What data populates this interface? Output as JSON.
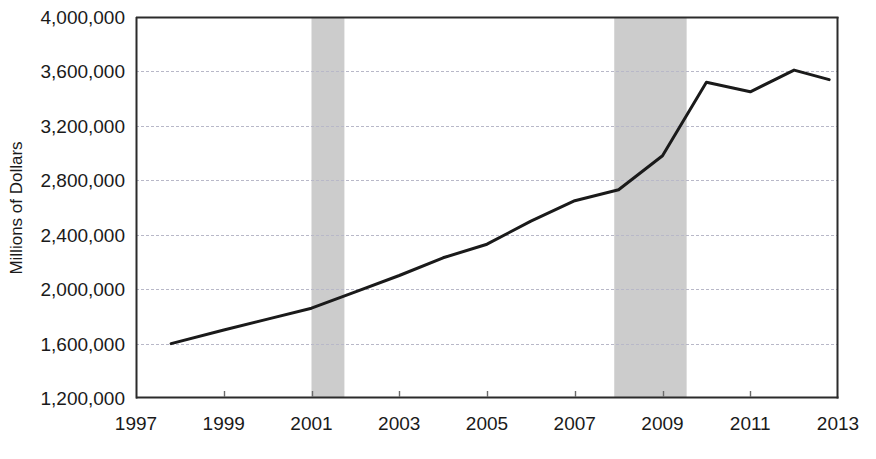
{
  "chart_data": {
    "type": "line",
    "title": "",
    "xlabel": "",
    "ylabel": "Millions of Dollars",
    "xlim": [
      1997,
      2013
    ],
    "ylim": [
      1200000,
      4000000
    ],
    "grid": true,
    "legend": "none",
    "y_ticks": [
      1200000,
      1600000,
      2000000,
      2400000,
      2800000,
      3200000,
      3600000,
      4000000
    ],
    "y_tick_labels": [
      "1,200,000",
      "1,600,000",
      "2,000,000",
      "2,400,000",
      "2,800,000",
      "3,200,000",
      "3,600,000",
      "4,000,000"
    ],
    "x_ticks": [
      1997,
      1999,
      2001,
      2003,
      2005,
      2007,
      2009,
      2011,
      2013
    ],
    "x_tick_labels": [
      "1997",
      "1999",
      "2001",
      "2003",
      "2005",
      "2007",
      "2009",
      "2011",
      "2013"
    ],
    "series": [
      {
        "name": "Millions of Dollars",
        "color": "#1a1a1a",
        "line_width": 3,
        "x": [
          1997.8,
          1999.0,
          2000.0,
          2001.0,
          2002.0,
          2003.0,
          2004.0,
          2005.0,
          2006.0,
          2007.0,
          2008.0,
          2009.0,
          2010.0,
          2011.0,
          2012.0,
          2012.8
        ],
        "y": [
          1600000,
          1700000,
          1780000,
          1860000,
          1980000,
          2100000,
          2230000,
          2330000,
          2500000,
          2650000,
          2730000,
          2980000,
          3520000,
          3450000,
          3610000,
          3540000
        ]
      }
    ],
    "shaded_regions": [
      {
        "name": "recession-2001",
        "x_start": 2001.0,
        "x_end": 2001.75,
        "color": "#cccccc"
      },
      {
        "name": "recession-2008",
        "x_start": 2007.9,
        "x_end": 2009.55,
        "color": "#cccccc"
      }
    ],
    "axis_color": "#2b2b2b",
    "grid_color": "#b8b8c8"
  }
}
